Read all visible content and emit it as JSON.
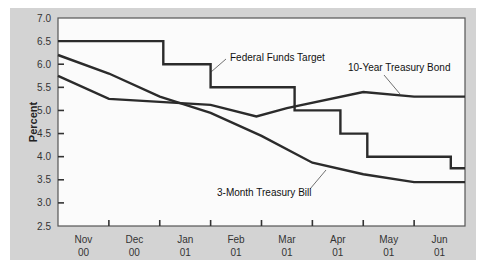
{
  "chart_data": {
    "type": "line",
    "title": "",
    "xlabel": "",
    "ylabel": "Percent",
    "ylim": [
      2.5,
      7.0
    ],
    "yticks": [
      "7.0",
      "6.5",
      "6.0",
      "5.5",
      "5.0",
      "4.5",
      "4.0",
      "3.5",
      "3.0",
      "2.5"
    ],
    "categories": [
      {
        "month": "Nov",
        "year": "00"
      },
      {
        "month": "Dec",
        "year": "00"
      },
      {
        "month": "Jan",
        "year": "01"
      },
      {
        "month": "Feb",
        "year": "01"
      },
      {
        "month": "Mar",
        "year": "01"
      },
      {
        "month": "Apr",
        "year": "01"
      },
      {
        "month": "May",
        "year": "01"
      },
      {
        "month": "Jun",
        "year": "01"
      }
    ],
    "grid": false,
    "legend": "inline labels",
    "series": [
      {
        "name": "Federal Funds Target",
        "style": "step",
        "points": [
          [
            0.0,
            6.5
          ],
          [
            2.07,
            6.5
          ],
          [
            2.07,
            6.0
          ],
          [
            3.0,
            6.0
          ],
          [
            3.0,
            5.5
          ],
          [
            4.65,
            5.5
          ],
          [
            4.65,
            5.0
          ],
          [
            5.55,
            5.0
          ],
          [
            5.55,
            4.5
          ],
          [
            6.08,
            4.5
          ],
          [
            6.08,
            4.0
          ],
          [
            7.72,
            4.0
          ],
          [
            7.72,
            3.75
          ],
          [
            8.0,
            3.75
          ]
        ]
      },
      {
        "name": "10-Year Treasury Bond",
        "style": "line",
        "points": [
          [
            0.0,
            5.75
          ],
          [
            1.0,
            5.25
          ],
          [
            3.0,
            5.12
          ],
          [
            3.9,
            4.87
          ],
          [
            4.5,
            5.05
          ],
          [
            6.0,
            5.4
          ],
          [
            7.0,
            5.3
          ],
          [
            8.0,
            5.3
          ]
        ]
      },
      {
        "name": "3-Month Treasury Bill",
        "style": "line",
        "points": [
          [
            0.0,
            6.2
          ],
          [
            1.0,
            5.8
          ],
          [
            2.0,
            5.3
          ],
          [
            3.0,
            4.95
          ],
          [
            4.0,
            4.45
          ],
          [
            5.0,
            3.87
          ],
          [
            6.0,
            3.62
          ],
          [
            7.0,
            3.45
          ],
          [
            8.0,
            3.45
          ]
        ]
      }
    ],
    "annotations": [
      {
        "text": "Federal Funds Target",
        "x": 230,
        "y": 61
      },
      {
        "text": "10-Year Treasury Bond",
        "x": 348,
        "y": 70
      },
      {
        "text": "3-Month Treasury Bill",
        "x": 217,
        "y": 195
      }
    ]
  }
}
